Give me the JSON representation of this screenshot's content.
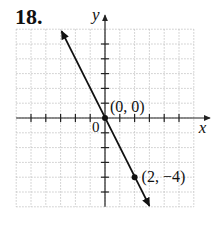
{
  "problem_number": "18.",
  "chart_data": {
    "type": "line",
    "title": "",
    "xlabel": "x",
    "ylabel": "y",
    "xlim": [
      -6,
      6
    ],
    "ylim": [
      -6,
      6
    ],
    "grid": true,
    "origin_label": "0",
    "line": {
      "slope": -2,
      "intercept": 0,
      "from": [
        -3,
        6
      ],
      "to": [
        3,
        -6
      ],
      "arrows": "both"
    },
    "points": [
      {
        "x": 0,
        "y": 0,
        "label": "(0, 0)"
      },
      {
        "x": 2,
        "y": -4,
        "label": "(2, −4)"
      }
    ]
  }
}
